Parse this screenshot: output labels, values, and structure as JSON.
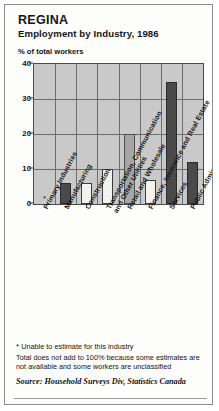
{
  "card": {
    "title": "REGINA",
    "subtitle": "Employment by Industry, 1986",
    "axis_caption": "% of total workers"
  },
  "notes": {
    "star_marker": "*",
    "star_note": "Unable to estimate for this industry",
    "body": "Total does not add to 100% because some estimates are not available and some workers are unclassified",
    "source": "Source: Household Surveys Div, Statistics Canada"
  },
  "colors": {
    "plot_background": "#c9c9c9",
    "grid": "#6d6d6d",
    "bar_dark": "#4a4a4a",
    "bar_light": "#f2f2ef",
    "bar_mid": "#a6a6a6",
    "card_background": "#fdfdfb",
    "border": "#8d8d8d"
  },
  "chart_data": {
    "type": "bar",
    "title": "Employment by Industry, 1986",
    "subtitle": "REGINA",
    "xlabel": "",
    "ylabel": "% of total workers",
    "ylim": [
      0,
      40
    ],
    "yticks": [
      0,
      10,
      20,
      30,
      40
    ],
    "grid": true,
    "legend": "none",
    "categories": [
      "Primary Industries",
      "Manufacturing",
      "Construction",
      "Transportation, Communication and Other Utilities",
      "Retail and Wholesale",
      "Finance, Insurance and Real Estate",
      "Services",
      "Public Administration"
    ],
    "values": [
      null,
      6,
      6,
      10,
      20,
      7,
      35,
      12
    ],
    "value_notes": [
      "*",
      "",
      "",
      "",
      "",
      "",
      "",
      ""
    ],
    "bar_styles": [
      "none",
      "dark",
      "light",
      "light",
      "mid",
      "light",
      "dark",
      "dark"
    ]
  },
  "category_labels": [
    {
      "line1": "Primary Industries",
      "line2": ""
    },
    {
      "line1": "Manufacturing",
      "line2": ""
    },
    {
      "line1": "Construction",
      "line2": ""
    },
    {
      "line1": "Transportation, Communication",
      "line2": "and Other Utilities"
    },
    {
      "line1": "Retail and Wholesale",
      "line2": ""
    },
    {
      "line1": "Finance, Insurance and Real Estate",
      "line2": ""
    },
    {
      "line1": "Services",
      "line2": ""
    },
    {
      "line1": "Public Administration",
      "line2": ""
    }
  ]
}
